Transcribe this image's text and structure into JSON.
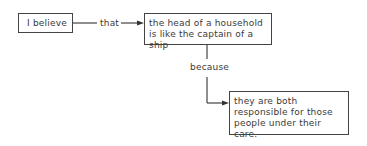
{
  "diagram": {
    "nodes": [
      {
        "id": "claim-intro",
        "text": "I believe"
      },
      {
        "id": "claim",
        "text": "the head of a household is like the captain of a ship"
      },
      {
        "id": "reason",
        "text": "they are both responsible for those people under their care."
      }
    ],
    "connectors": [
      {
        "from": "claim-intro",
        "to": "claim",
        "label": "that"
      },
      {
        "from": "claim",
        "to": "reason",
        "label": "because"
      }
    ],
    "colors": {
      "line": "#444444",
      "text": "#3a3a3a",
      "background": "#ffffff"
    }
  }
}
